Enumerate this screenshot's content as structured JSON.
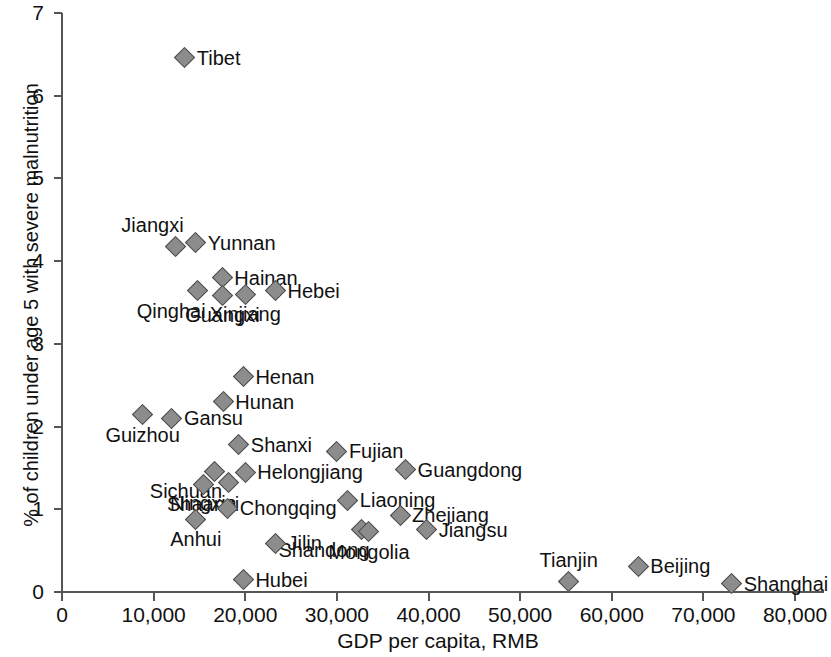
{
  "chart_data": {
    "type": "scatter",
    "title": "",
    "xlabel": "GDP per capita, RMB",
    "ylabel": "% of children under age 5 with severe malnutrition",
    "xlim": [
      0,
      80000
    ],
    "ylim": [
      0,
      7
    ],
    "xticks": [
      "0",
      "10,000",
      "20,000",
      "30,000",
      "40,000",
      "50,000",
      "60,000",
      "70,000",
      "80,000"
    ],
    "xtick_values": [
      0,
      10000,
      20000,
      30000,
      40000,
      50000,
      60000,
      70000,
      80000
    ],
    "yticks": [
      "0",
      "1",
      "2",
      "3",
      "4",
      "5",
      "6",
      "7"
    ],
    "ytick_values": [
      0,
      1,
      2,
      3,
      4,
      5,
      6,
      7
    ],
    "grid": false,
    "legend": "none",
    "marker": {
      "shape": "diamond",
      "fill": "#8c8c8c",
      "stroke": "#4a4a4a",
      "size_px": 15
    },
    "points": [
      {
        "label": "Tibet",
        "x": 13400,
        "y": 6.46,
        "label_pos": "right"
      },
      {
        "label": "Jiangxi",
        "x": 12400,
        "y": 4.18,
        "label_pos": "above-left"
      },
      {
        "label": "Yunnan",
        "x": 14600,
        "y": 4.22,
        "label_pos": "right"
      },
      {
        "label": "Hainan",
        "x": 17500,
        "y": 3.8,
        "label_pos": "right"
      },
      {
        "label": "Qinghai",
        "x": 14800,
        "y": 3.64,
        "label_pos": "below-left"
      },
      {
        "label": "Guangxi",
        "x": 17500,
        "y": 3.59,
        "label_pos": "below"
      },
      {
        "label": "Xinjiang",
        "x": 20000,
        "y": 3.6,
        "label_pos": "below"
      },
      {
        "label": "Hebei",
        "x": 23300,
        "y": 3.64,
        "label_pos": "right"
      },
      {
        "label": "Henan",
        "x": 19800,
        "y": 2.6,
        "label_pos": "right"
      },
      {
        "label": "Hunan",
        "x": 17600,
        "y": 2.3,
        "label_pos": "right"
      },
      {
        "label": "Guizhou",
        "x": 8800,
        "y": 2.14,
        "label_pos": "below"
      },
      {
        "label": "Gansu",
        "x": 12000,
        "y": 2.1,
        "label_pos": "right"
      },
      {
        "label": "Shanxi",
        "x": 19300,
        "y": 1.78,
        "label_pos": "right"
      },
      {
        "label": "Fujian",
        "x": 30000,
        "y": 1.7,
        "label_pos": "right"
      },
      {
        "label": "Sichuan",
        "x": 16600,
        "y": 1.46,
        "label_pos": "below-left"
      },
      {
        "label": "Helongjiang",
        "x": 20000,
        "y": 1.45,
        "label_pos": "right"
      },
      {
        "label": "Guangdong",
        "x": 37500,
        "y": 1.48,
        "label_pos": "right"
      },
      {
        "label": "Shaanxi",
        "x": 15400,
        "y": 1.3,
        "label_pos": "below"
      },
      {
        "label": "Ningxia",
        "x": 18200,
        "y": 1.32,
        "label_pos": "below-left"
      },
      {
        "label": "Liaoning",
        "x": 31200,
        "y": 1.11,
        "label_pos": "right"
      },
      {
        "label": "Chongqing",
        "x": 18100,
        "y": 1.01,
        "label_pos": "right"
      },
      {
        "label": "Anhui",
        "x": 14600,
        "y": 0.88,
        "label_pos": "below"
      },
      {
        "label": "Shandong",
        "x": 32700,
        "y": 0.75,
        "label_pos": "below-left"
      },
      {
        "label": "Mongolia",
        "x": 33500,
        "y": 0.73,
        "label_pos": "below"
      },
      {
        "label": "Zhejiang",
        "x": 36900,
        "y": 0.93,
        "label_pos": "right"
      },
      {
        "label": "Jiangsu",
        "x": 39800,
        "y": 0.75,
        "label_pos": "right"
      },
      {
        "label": "Jilin",
        "x": 23300,
        "y": 0.59,
        "label_pos": "right"
      },
      {
        "label": "Hubei",
        "x": 19800,
        "y": 0.15,
        "label_pos": "right"
      },
      {
        "label": "Tianjin",
        "x": 55300,
        "y": 0.13,
        "label_pos": "above"
      },
      {
        "label": "Beijing",
        "x": 62900,
        "y": 0.31,
        "label_pos": "right"
      },
      {
        "label": "Shanghai",
        "x": 73100,
        "y": 0.1,
        "label_pos": "right"
      }
    ]
  }
}
